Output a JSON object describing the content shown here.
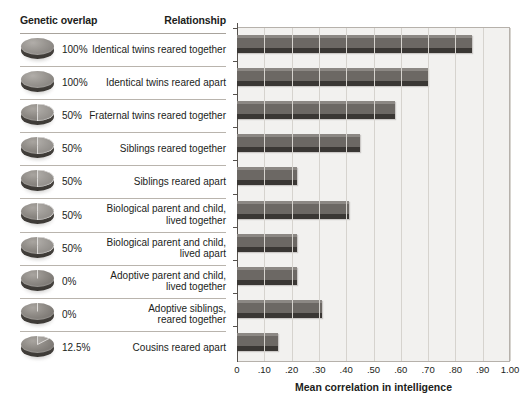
{
  "headers": {
    "genetic_overlap": "Genetic overlap",
    "relationship": "Relationship"
  },
  "rows": [
    {
      "overlap_label": "100%",
      "overlap_value": 100,
      "relationship": "Identical twins reared together",
      "correlation": 0.86
    },
    {
      "overlap_label": "100%",
      "overlap_value": 100,
      "relationship": "Identical twins reared apart",
      "correlation": 0.7
    },
    {
      "overlap_label": "50%",
      "overlap_value": 50,
      "relationship": "Fraternal twins reared together",
      "correlation": 0.58
    },
    {
      "overlap_label": "50%",
      "overlap_value": 50,
      "relationship": "Siblings reared together",
      "correlation": 0.45
    },
    {
      "overlap_label": "50%",
      "overlap_value": 50,
      "relationship": "Siblings reared apart",
      "correlation": 0.22
    },
    {
      "overlap_label": "50%",
      "overlap_value": 50,
      "relationship": "Biological parent and child,\nlived together",
      "correlation": 0.41
    },
    {
      "overlap_label": "50%",
      "overlap_value": 50,
      "relationship": "Biological parent and child,\nlived apart",
      "correlation": 0.22
    },
    {
      "overlap_label": "0%",
      "overlap_value": 0,
      "relationship": "Adoptive parent and child,\nlived together",
      "correlation": 0.22
    },
    {
      "overlap_label": "0%",
      "overlap_value": 0,
      "relationship": "Adoptive siblings,\nreared together",
      "correlation": 0.31
    },
    {
      "overlap_label": "12.5%",
      "overlap_value": 12.5,
      "relationship": "Cousins reared apart",
      "correlation": 0.15
    }
  ],
  "chart_data": {
    "type": "bar",
    "orientation": "horizontal",
    "title": "",
    "xlabel": "Mean correlation in intelligence",
    "ylabel": "",
    "xlim": [
      0,
      1.0
    ],
    "xticks": [
      0,
      0.1,
      0.2,
      0.3,
      0.4,
      0.5,
      0.6,
      0.7,
      0.8,
      0.9,
      1.0
    ],
    "xticklabels": [
      "0",
      ".10",
      ".20",
      ".30",
      ".40",
      ".50",
      ".60",
      ".70",
      ".80",
      ".90",
      "1.00"
    ],
    "grid": "vertical",
    "legend": "none",
    "categories": [
      "Identical twins reared together",
      "Identical twins reared apart",
      "Fraternal twins reared together",
      "Siblings reared together",
      "Siblings reared apart",
      "Biological parent and child, lived together",
      "Biological parent and child, lived apart",
      "Adoptive parent and child, lived together",
      "Adoptive siblings, reared together",
      "Cousins reared apart"
    ],
    "values": [
      0.86,
      0.7,
      0.58,
      0.45,
      0.22,
      0.41,
      0.22,
      0.22,
      0.31,
      0.15
    ],
    "genetic_overlap_percent": [
      100,
      100,
      50,
      50,
      50,
      50,
      50,
      0,
      0,
      12.5
    ],
    "bar_color": "#6c6864",
    "plot_background": "#f2f1ef",
    "gridline_color": "#d6d3ce",
    "axis_color": "#56524e",
    "text_color": "#211d1a"
  },
  "icons": {
    "disc": "pie-disc-icon"
  }
}
